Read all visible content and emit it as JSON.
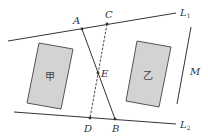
{
  "diagram": {
    "colors": {
      "line": "#333333",
      "rect_fill": "#d3d3d3",
      "rect_stroke": "#555555",
      "background": "#ffffff"
    },
    "lines": {
      "L1": {
        "label": "L",
        "sub": "1",
        "from": [
          8,
          41
        ],
        "to": [
          176,
          13
        ]
      },
      "L2": {
        "label": "L",
        "sub": "2",
        "from": [
          14,
          112
        ],
        "to": [
          176,
          124
        ]
      },
      "AB": {
        "from": "A",
        "to": "B",
        "style": "solid"
      },
      "CD": {
        "from": "C",
        "to": "D",
        "style": "dashed"
      },
      "M": {
        "label": "M",
        "from": [
          191,
          27
        ],
        "to": [
          177,
          104
        ]
      }
    },
    "points": {
      "A": {
        "label": "A",
        "pos": [
          82,
          29
        ]
      },
      "C": {
        "label": "C",
        "pos": [
          107,
          24
        ]
      },
      "E": {
        "label": "E",
        "pos": [
          98,
          73
        ]
      },
      "D": {
        "label": "D",
        "pos": [
          90,
          118
        ]
      },
      "B": {
        "label": "B",
        "pos": [
          115,
          119
        ]
      }
    },
    "regions": [
      {
        "label": "甲",
        "corners": [
          [
            39,
            43
          ],
          [
            73,
            49
          ],
          [
            61,
            109
          ],
          [
            27,
            103
          ]
        ]
      },
      {
        "label": "乙",
        "corners": [
          [
            137,
            41
          ],
          [
            171,
            47
          ],
          [
            159,
            107
          ],
          [
            126,
            101
          ]
        ]
      }
    ]
  }
}
